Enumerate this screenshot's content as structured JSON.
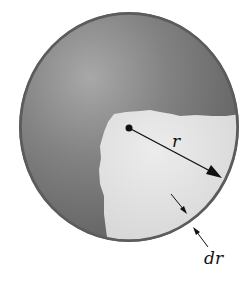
{
  "diagram": {
    "labels": {
      "radius": "r",
      "thickness": "dr"
    },
    "colors": {
      "sphere_dark": "#6e6e6e",
      "sphere_light": "#a8a8a8",
      "cutaway": "#e2e2e2",
      "rim": "#555555",
      "arrow": "#111111"
    }
  }
}
